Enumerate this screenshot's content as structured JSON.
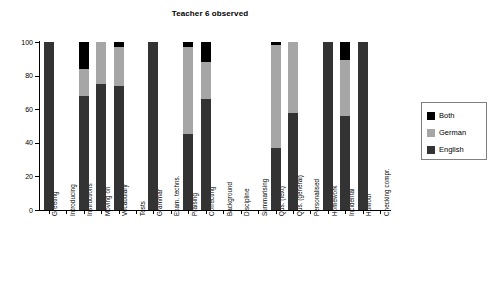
{
  "chart_data": {
    "type": "bar",
    "subtype": "stacked-percentage",
    "title": "Teacher 6 observed",
    "xlabel": "",
    "ylabel": "",
    "ylim": [
      0,
      100
    ],
    "yticks": [
      0,
      20,
      40,
      60,
      80,
      100
    ],
    "grid": false,
    "legend_position": "right",
    "categories": [
      "Greeting",
      "Introducing",
      "Instructions",
      "Moving on",
      "Vocabulary",
      "Tests",
      "Grammar",
      "Exam. techns.",
      "Praising",
      "Correcting",
      "Background",
      "Discipline",
      "Summarising",
      "Qus. (text)",
      "Qus. (general)",
      "Personalised",
      "Homework",
      "Incidental",
      "Humour",
      "Checking compr."
    ],
    "series": [
      {
        "name": "English",
        "color": "#333333",
        "values": [
          100,
          0,
          68,
          75,
          74,
          0,
          100,
          0,
          45,
          66,
          0,
          0,
          0,
          37,
          58,
          0,
          100,
          56,
          100,
          0
        ]
      },
      {
        "name": "German",
        "color": "#a6a6a6",
        "values": [
          0,
          0,
          16,
          25,
          23,
          0,
          0,
          0,
          52,
          22,
          0,
          0,
          0,
          61,
          42,
          0,
          0,
          33,
          0,
          0
        ]
      },
      {
        "name": "Both",
        "color": "#000000",
        "values": [
          0,
          0,
          16,
          0,
          3,
          0,
          0,
          0,
          3,
          12,
          0,
          0,
          0,
          2,
          0,
          0,
          0,
          11,
          0,
          0
        ]
      }
    ],
    "legend_entries": [
      {
        "label": "Both",
        "color": "#000000"
      },
      {
        "label": "German",
        "color": "#a6a6a6"
      },
      {
        "label": "English",
        "color": "#333333"
      }
    ]
  }
}
